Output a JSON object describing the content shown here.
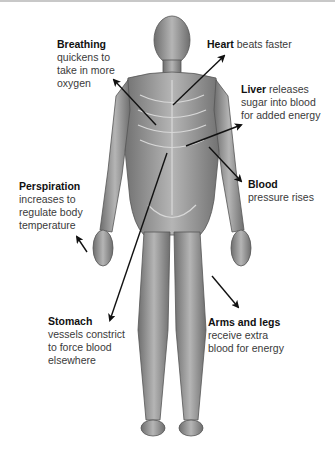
{
  "diagram": {
    "labels": {
      "breathing": {
        "title": "Breathing",
        "lines": [
          "quickens to",
          "take in more",
          "oxygen"
        ]
      },
      "heart": {
        "title": "Heart",
        "text": "beats faster"
      },
      "liver": {
        "title": "Liver",
        "first": "releases",
        "lines": [
          "sugar into blood",
          "for added energy"
        ]
      },
      "blood": {
        "title": "Blood",
        "lines": [
          "pressure rises"
        ]
      },
      "perspiration": {
        "title": "Perspiration",
        "lines": [
          "increases to",
          "regulate body",
          "temperature"
        ]
      },
      "stomach": {
        "title": "Stomach",
        "lines": [
          "vessels constrict",
          "to force blood",
          "elsewhere"
        ]
      },
      "arms_legs": {
        "title": "Arms and legs",
        "lines": [
          "receive extra",
          "blood for energy"
        ]
      }
    },
    "colors": {
      "text": "#333333",
      "title": "#111111",
      "arrow": "#111111",
      "body": "#8a8a8a"
    }
  }
}
